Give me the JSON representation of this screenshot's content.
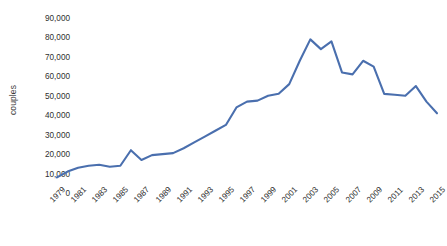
{
  "chart_data": {
    "type": "line",
    "title": "",
    "xlabel": "",
    "ylabel": "couples",
    "grid": false,
    "legend": "none",
    "line_color": "#4a6fae",
    "background_color": "#ffffff",
    "xlim": [
      1979,
      2015
    ],
    "ylim": [
      0,
      90000
    ],
    "ytick_step": 10000,
    "xtick_step": 2,
    "ytick_labels": [
      "90,000",
      "80,000",
      "70,000",
      "60,000",
      "50,000",
      "40,000",
      "30,000",
      "20,000",
      "10,000",
      "0"
    ],
    "ytick_values": [
      90000,
      80000,
      70000,
      60000,
      50000,
      40000,
      30000,
      20000,
      10000,
      0
    ],
    "xtick_labels": [
      "1979",
      "1981",
      "1983",
      "1985",
      "1987",
      "1989",
      "1991",
      "1993",
      "1995",
      "1997",
      "1999",
      "2001",
      "2003",
      "2005",
      "2007",
      "2009",
      "2011",
      "2013",
      "2015"
    ],
    "x": [
      1979,
      1980,
      1981,
      1982,
      1983,
      1984,
      1985,
      1986,
      1987,
      1988,
      1989,
      1990,
      1991,
      1992,
      1993,
      1994,
      1995,
      1996,
      1997,
      1998,
      1999,
      2000,
      2001,
      2002,
      2003,
      2004,
      2005,
      2006,
      2007,
      2008,
      2009,
      2010,
      2011,
      2012,
      2013,
      2014,
      2015
    ],
    "series": [
      {
        "name": "couples",
        "values": [
          8000,
          11000,
          13000,
          14000,
          14500,
          13500,
          14000,
          22000,
          17000,
          19500,
          20000,
          20500,
          23000,
          26000,
          29000,
          32000,
          35000,
          44000,
          47000,
          47500,
          50000,
          51000,
          56000,
          68000,
          79000,
          74000,
          78000,
          62000,
          61000,
          68000,
          65000,
          51000,
          50500,
          50000,
          55000,
          47000,
          41000
        ]
      }
    ]
  }
}
